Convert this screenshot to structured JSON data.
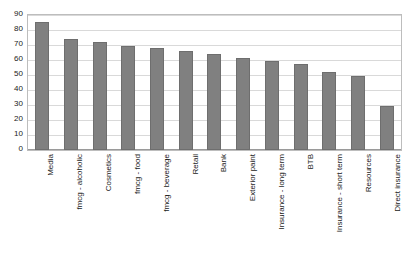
{
  "chart_data": {
    "type": "bar",
    "title": "",
    "subtitle": "",
    "xlabel": "",
    "ylabel": "",
    "ylim": [
      0,
      90
    ],
    "ytick_step": 10,
    "yticks": [
      90,
      80,
      70,
      60,
      50,
      40,
      30,
      20,
      10,
      0
    ],
    "grid": true,
    "legend": false,
    "legend_position": "none",
    "orientation": "vertical",
    "bar_color": "#808080",
    "bar_border_color": "#6e6e6e",
    "gridline_color": "#d9d9d9",
    "plot_border_color": "#bdbdbd",
    "background_color": "#ffffff",
    "categories": [
      "Media",
      "fmcg - alcoholic",
      "Cosmetics",
      "fmcg - food",
      "fmcg - beverage",
      "Retail",
      "Bank",
      "Exterior paint",
      "Insurance - long term",
      "BTB",
      "Insurance - short term",
      "Resources",
      "Direct insurance"
    ],
    "values": [
      85,
      74,
      72,
      69,
      68,
      66,
      64,
      61,
      59,
      57,
      52,
      49,
      29
    ]
  }
}
